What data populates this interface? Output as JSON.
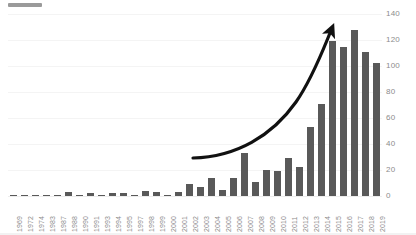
{
  "title_placeholder": {
    "label": "redacted-title-bar"
  },
  "colors": {
    "bar": "#595959",
    "gridline": "#f4f4f4",
    "axis_text": "#8c8c8c",
    "arrow": "#111111",
    "background": "#ffffff"
  },
  "annotation": {
    "arrow_label": "growth-trend-arrow",
    "start_year": "2002",
    "end_year": "2016"
  },
  "chart_data": {
    "type": "bar",
    "title": "",
    "subtitle": "",
    "xlabel": "",
    "ylabel": "",
    "ylim": [
      0,
      140
    ],
    "yticks": [
      0,
      20,
      40,
      60,
      80,
      100,
      120,
      140
    ],
    "ytick_labels": [
      "0",
      "20",
      "40",
      "60",
      "80",
      "100",
      "120",
      "140"
    ],
    "grid": true,
    "legend": "none",
    "categories": [
      "1969",
      "1972",
      "1974",
      "1983",
      "1987",
      "1988",
      "1990",
      "1991",
      "1993",
      "1994",
      "1995",
      "1997",
      "1998",
      "1999",
      "2000",
      "2001",
      "2002",
      "2003",
      "2004",
      "2005",
      "2006",
      "2007",
      "2008",
      "2009",
      "2010",
      "2011",
      "2012",
      "2013",
      "2014",
      "2015",
      "2016",
      "2017",
      "2018",
      "2019"
    ],
    "values": [
      1,
      1,
      1,
      1,
      1,
      3,
      1,
      2,
      1,
      2,
      2,
      1,
      4,
      3,
      1,
      3,
      9,
      7,
      14,
      5,
      14,
      33,
      11,
      20,
      19,
      29,
      22,
      53,
      71,
      119,
      115,
      128,
      111,
      102
    ]
  }
}
